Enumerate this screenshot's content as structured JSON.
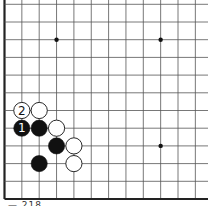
{
  "board": {
    "origin_x": 4.5,
    "origin_y": 199,
    "spacing_x": 17.35,
    "spacing_y": 17.7,
    "cols": 12,
    "rows": 12,
    "edges": {
      "left": true,
      "bottom": true,
      "top": false,
      "right": false
    },
    "line_color": "#555555",
    "edge_color": "#222222",
    "background": "#ffffff",
    "star_points": [
      {
        "col": 3,
        "row": 9
      },
      {
        "col": 9,
        "row": 9
      },
      {
        "col": 9,
        "row": 3
      }
    ]
  },
  "stones": [
    {
      "color": "white",
      "col": 1,
      "row": 5,
      "label": "2"
    },
    {
      "color": "white",
      "col": 2,
      "row": 5,
      "label": ""
    },
    {
      "color": "black",
      "col": 1,
      "row": 4,
      "label": "1"
    },
    {
      "color": "black",
      "col": 2,
      "row": 4,
      "label": ""
    },
    {
      "color": "white",
      "col": 3,
      "row": 4,
      "label": ""
    },
    {
      "color": "black",
      "col": 3,
      "row": 3,
      "label": ""
    },
    {
      "color": "white",
      "col": 4,
      "row": 3,
      "label": ""
    },
    {
      "color": "black",
      "col": 2,
      "row": 2,
      "label": ""
    },
    {
      "color": "white",
      "col": 4,
      "row": 2,
      "label": ""
    }
  ],
  "caption": "— 218"
}
